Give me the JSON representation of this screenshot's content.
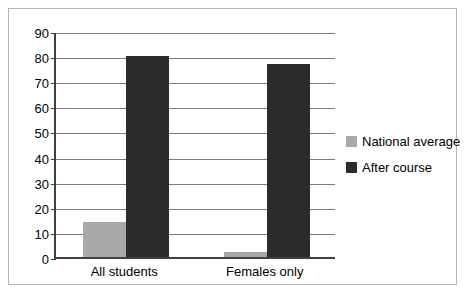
{
  "chart_data": {
    "type": "bar",
    "title": "",
    "xlabel": "",
    "ylabel": "",
    "categories": [
      "All students",
      "Females only"
    ],
    "series": [
      {
        "name": "National average",
        "values": [
          14,
          2
        ],
        "color": "#a8a8a8"
      },
      {
        "name": "After course",
        "values": [
          80,
          77
        ],
        "color": "#2b2b2b"
      }
    ],
    "ylim": [
      0,
      90
    ],
    "ytick_step": 10,
    "yticks": [
      0,
      10,
      20,
      30,
      40,
      50,
      60,
      70,
      80,
      90
    ],
    "ytick_labels": [
      "0",
      "10",
      "20",
      "30",
      "40",
      "50",
      "60",
      "70",
      "80",
      "90"
    ],
    "grid": true,
    "legend_position": "right",
    "legend_entries": [
      "National average",
      "After course"
    ]
  },
  "colors": {
    "national_average": "#a8a8a8",
    "after_course": "#2b2b2b",
    "gridline": "#7a7a7a",
    "axis": "#404040",
    "frame": "#b5b5b5",
    "background": "#ffffff"
  }
}
